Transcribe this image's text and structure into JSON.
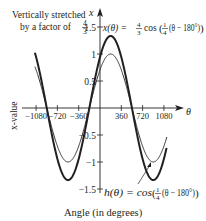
{
  "chart_data": {
    "type": "line",
    "title": "",
    "xlabel": "Angle (in degrees)",
    "ylabel": "x-value",
    "x_axis_symbol": "θ",
    "y_axis_symbol": "x",
    "xlim": [
      -1110,
      1130
    ],
    "ylim": [
      -1.6,
      1.6
    ],
    "x_ticks": [
      -1080,
      -720,
      -360,
      360,
      720,
      1080
    ],
    "x_tick_labels": [
      "−1080",
      "−720",
      "−360",
      "360",
      "720",
      "1080"
    ],
    "y_ticks": [
      1.5,
      1,
      0.5,
      -0.5,
      -1,
      -1.5
    ],
    "y_tick_labels": [
      "1.5",
      "1",
      "0.5",
      "−0.5",
      "−1",
      "−1.5"
    ],
    "grid": false,
    "series": [
      {
        "name": "x(θ) = 4/3 cos(1/4(θ − 180°))",
        "amplitude": 1.3333,
        "frequency": 0.25,
        "phase_shift_deg": 180,
        "style": "thick",
        "x": [
          -1080,
          -900,
          -540,
          -180,
          180,
          540,
          900,
          1080
        ],
        "values": [
          1.232,
          0,
          -1.333,
          0,
          1.333,
          0,
          -1.333,
          -1.232
        ]
      },
      {
        "name": "h(θ) = cos(1/4(θ − 180°))",
        "amplitude": 1,
        "frequency": 0.25,
        "phase_shift_deg": 180,
        "style": "thin",
        "x": [
          -1080,
          -900,
          -540,
          -180,
          180,
          540,
          900,
          1080
        ],
        "values": [
          0.924,
          0,
          -1,
          0,
          1,
          0,
          -1,
          -0.924
        ]
      }
    ],
    "annotations": [
      {
        "text": "Vertically stretched",
        "line": 1
      },
      {
        "text": "by a factor of 4/3",
        "line": 2
      },
      {
        "text": "x(θ) = 4/3 cos(1/4(θ − 180°))",
        "target": "thick curve"
      },
      {
        "text": "h(θ) = cos(1/4(θ − 180°))",
        "target": "thin curve",
        "arrow": true
      }
    ]
  },
  "labels": {
    "stretch_line1": "Vertically stretched",
    "stretch_line2": "by a factor of",
    "frac_num": "4",
    "frac_den": "3",
    "x_fn_name": "x(θ) = ",
    "x_fn_cos": "cos",
    "x_fn_inner": "(θ − 180°)",
    "h_fn_name": "h(θ) = cos",
    "h_fn_inner": "(θ − 180°)",
    "quarter_num": "1",
    "quarter_den": "4",
    "xlabel": "Angle (in degrees)",
    "ylabel": "x-value",
    "x_axis_symbol": "θ",
    "y_axis_symbol": "x"
  }
}
